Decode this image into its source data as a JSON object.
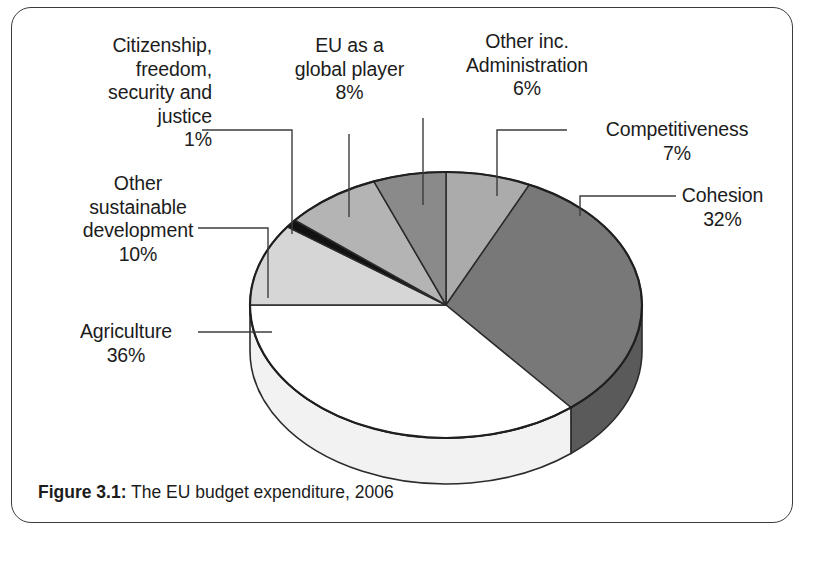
{
  "figure": {
    "caption_label": "Figure 3.1:",
    "caption_text": "The EU budget expenditure, 2006"
  },
  "chart_data": {
    "type": "pie",
    "title": "The EU budget expenditure, 2006",
    "subtitle": "",
    "xlabel": "",
    "ylabel": "",
    "units": "percent",
    "three_d": true,
    "legend_position": "callout-labels",
    "grid": false,
    "categories": [
      "Competitiveness",
      "Cohesion",
      "Agriculture",
      "Other sustainable development",
      "Citizenship, freedom, security and justice",
      "EU as a global player",
      "Other inc. Administration"
    ],
    "values": [
      7,
      32,
      36,
      10,
      1,
      8,
      6
    ],
    "colors": [
      "#ababab",
      "#787878",
      "#ffffff",
      "#d6d6d6",
      "#121212",
      "#b4b4b4",
      "#8a8a8a"
    ],
    "side_colors": [
      "#8c8c8c",
      "#5a5a5a",
      "#f2f2f2",
      "#b8b8b8",
      "#0a0a0a",
      "#969696",
      "#6e6e6e"
    ],
    "start_angle_deg": 0,
    "direction": "clockwise",
    "labels": [
      {
        "name": "Competitiveness",
        "value": 7,
        "text": "Competitiveness\n7%"
      },
      {
        "name": "Cohesion",
        "value": 32,
        "text": "Cohesion\n32%"
      },
      {
        "name": "Agriculture",
        "value": 36,
        "text": "Agriculture\n36%"
      },
      {
        "name": "Other sustainable development",
        "value": 10,
        "text": "Other\nsustainable\ndevelopment\n10%"
      },
      {
        "name": "Citizenship, freedom, security and justice",
        "value": 1,
        "text": "Citizenship,\nfreedom,\nsecurity and\njustice\n1%"
      },
      {
        "name": "EU as a global player",
        "value": 8,
        "text": "EU as a\nglobal player\n8%"
      },
      {
        "name": "Other inc. Administration",
        "value": 6,
        "text": "Other inc.\nAdministration\n6%"
      }
    ]
  },
  "callouts": {
    "citizenship": "Citizenship,\nfreedom,\nsecurity and\njustice\n1%",
    "eu_global_player": "EU as a\nglobal player\n8%",
    "other_admin": "Other inc.\nAdministration\n6%",
    "competitiveness": "Competitiveness\n7%",
    "cohesion": "Cohesion\n32%",
    "other_sustainable": "Other\nsustainable\ndevelopment\n10%",
    "agriculture": "Agriculture\n36%"
  }
}
